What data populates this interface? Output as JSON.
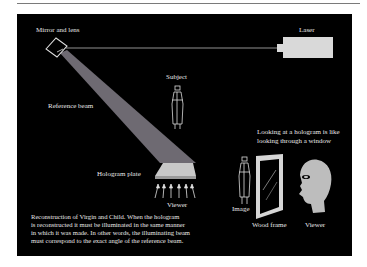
{
  "labels": {
    "mirror": "Mirror and lens",
    "laser": "Laser",
    "subject": "Subject",
    "reference_beam": "Reference beam",
    "hologram_plate": "Hologram plate",
    "viewer_bottom": "Viewer",
    "window_note_line1": "Looking at a hologram is like",
    "window_note_line2": "looking through a window",
    "image": "Image",
    "wood_frame": "Wood frame",
    "viewer_right": "Viewer"
  },
  "caption": {
    "line1": "Reconstruction of Virgin and Child. When the hologram",
    "line2": "is reconstructed it must be illuminated in the same manner",
    "line3": "in which it was made. In other words, the illuminating beam",
    "line4": "must correspond to the exact angle of the reference beam."
  },
  "colors": {
    "background": "#000000",
    "beam": "#6e6a72",
    "laser_body": "#d9d9d9",
    "plate": "#c8c8c8",
    "head": "#bdbdbd",
    "text": "#e8e8e8"
  }
}
